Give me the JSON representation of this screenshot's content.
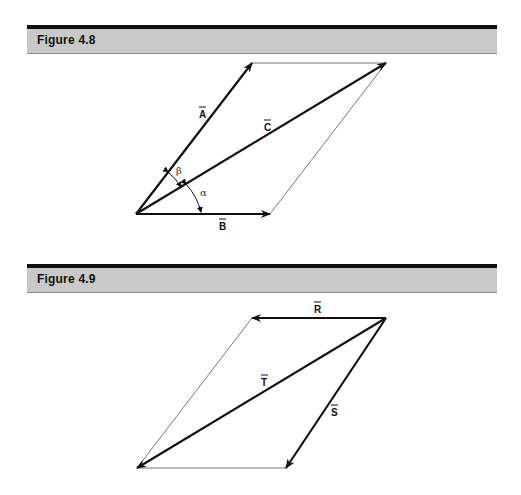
{
  "figures": [
    {
      "title": "Figure 4.8",
      "vectors": [
        {
          "name": "A",
          "label": "A̅",
          "from": [
            136,
            214
          ],
          "to": [
            252,
            63
          ]
        },
        {
          "name": "B",
          "label": "B̅",
          "from": [
            136,
            214
          ],
          "to": [
            270,
            214
          ]
        },
        {
          "name": "C",
          "label": "C̅",
          "from": [
            136,
            214
          ],
          "to": [
            386,
            63
          ]
        }
      ],
      "construction_lines": [
        {
          "from": [
            252,
            63
          ],
          "to": [
            386,
            63
          ]
        },
        {
          "from": [
            270,
            214
          ],
          "to": [
            386,
            63
          ]
        }
      ],
      "angles": [
        {
          "symbol": "β",
          "between": [
            "A",
            "C"
          ]
        },
        {
          "symbol": "α",
          "between": [
            "C",
            "B"
          ]
        }
      ]
    },
    {
      "title": "Figure 4.9",
      "vectors": [
        {
          "name": "R",
          "label": "R̅",
          "from": [
            386,
            318
          ],
          "to": [
            252,
            318
          ]
        },
        {
          "name": "S",
          "label": "S̅",
          "from": [
            386,
            318
          ],
          "to": [
            286,
            468
          ]
        },
        {
          "name": "T",
          "label": "T̅",
          "from": [
            386,
            318
          ],
          "to": [
            137,
            468
          ]
        }
      ],
      "construction_lines": [
        {
          "from": [
            252,
            318
          ],
          "to": [
            137,
            468
          ]
        },
        {
          "from": [
            137,
            468
          ],
          "to": [
            286,
            468
          ]
        }
      ]
    }
  ],
  "labels": {
    "fig48_title": "Figure 4.8",
    "fig49_title": "Figure 4.9",
    "A": "A",
    "B": "B",
    "C": "C",
    "R": "R",
    "S": "S",
    "T": "T",
    "beta": "β",
    "alpha": "α"
  }
}
